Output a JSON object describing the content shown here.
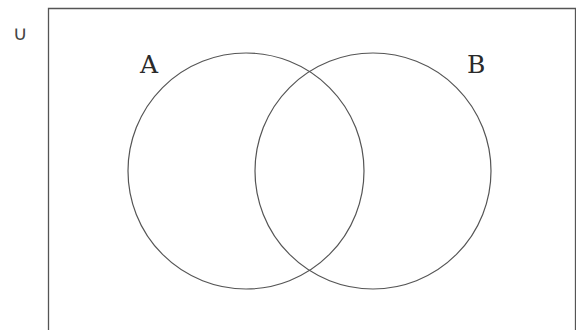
{
  "diagram": {
    "type": "venn",
    "universe_symbol": "∪",
    "sets": [
      {
        "label": "A",
        "cx": 246,
        "cy": 171,
        "r": 118
      },
      {
        "label": "B",
        "cx": 373,
        "cy": 171,
        "r": 118
      }
    ],
    "colors": {
      "stroke": "#555555",
      "frame": "#555555",
      "background": "#ffffff"
    }
  }
}
